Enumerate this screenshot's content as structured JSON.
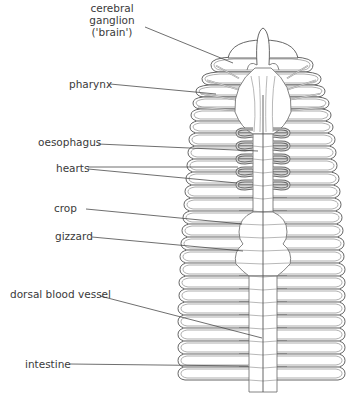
{
  "labels": [
    {
      "id": "cerebral-ganglion",
      "lines": [
        "cerebral",
        "ganglion",
        "('brain')"
      ],
      "x": 112,
      "y": 12,
      "anchor": "middle",
      "leader": [
        [
          145,
          27
        ],
        [
          233,
          63
        ]
      ]
    },
    {
      "id": "pharynx",
      "lines": [
        "pharynx"
      ],
      "x": 69,
      "y": 88,
      "anchor": "start",
      "leader": [
        [
          110,
          84
        ],
        [
          216,
          94
        ]
      ]
    },
    {
      "id": "oesophagus",
      "lines": [
        "oesophagus"
      ],
      "x": 38,
      "y": 146,
      "anchor": "start",
      "leader": [
        [
          98,
          144
        ],
        [
          258,
          151
        ]
      ]
    },
    {
      "id": "hearts",
      "lines": [
        "hearts"
      ],
      "x": 56,
      "y": 172,
      "anchor": "start",
      "leader": [
        [
          88,
          167
        ],
        [
          238,
          167
        ]
      ],
      "leader2": [
        [
          88,
          169
        ],
        [
          237,
          183
        ]
      ]
    },
    {
      "id": "crop",
      "lines": [
        "crop"
      ],
      "x": 54,
      "y": 212,
      "anchor": "start",
      "leader": [
        [
          86,
          209
        ],
        [
          242,
          224
        ]
      ]
    },
    {
      "id": "gizzard",
      "lines": [
        "gizzard"
      ],
      "x": 55,
      "y": 240,
      "anchor": "start",
      "leader": [
        [
          92,
          237
        ],
        [
          243,
          251
        ]
      ]
    },
    {
      "id": "dorsal-blood-vessel",
      "lines": [
        "dorsal blood vessel"
      ],
      "x": 10,
      "y": 298,
      "anchor": "start",
      "leader": [
        [
          100,
          296
        ],
        [
          262,
          338
        ]
      ]
    },
    {
      "id": "intestine",
      "lines": [
        "intestine"
      ],
      "x": 25,
      "y": 368,
      "anchor": "start",
      "leader": [
        [
          70,
          364
        ],
        [
          248,
          366
        ]
      ]
    }
  ],
  "worm": {
    "center_x": 263,
    "segments": [
      {
        "y": 57,
        "l": 228,
        "r": 298
      },
      {
        "y": 72,
        "l": 214,
        "r": 310
      },
      {
        "y": 85,
        "l": 205,
        "r": 318
      },
      {
        "y": 97,
        "l": 199,
        "r": 322
      },
      {
        "y": 109,
        "l": 196,
        "r": 326
      },
      {
        "y": 121,
        "l": 194,
        "r": 328
      },
      {
        "y": 133,
        "l": 193,
        "r": 330
      },
      {
        "y": 146,
        "l": 192,
        "r": 332
      },
      {
        "y": 159,
        "l": 191,
        "r": 333
      },
      {
        "y": 172,
        "l": 190,
        "r": 334
      },
      {
        "y": 185,
        "l": 189,
        "r": 336
      },
      {
        "y": 198,
        "l": 188,
        "r": 337
      },
      {
        "y": 211,
        "l": 187,
        "r": 338
      },
      {
        "y": 224,
        "l": 186,
        "r": 339
      },
      {
        "y": 237,
        "l": 185,
        "r": 340
      },
      {
        "y": 250,
        "l": 184,
        "r": 341
      },
      {
        "y": 263,
        "l": 183,
        "r": 341
      },
      {
        "y": 276,
        "l": 183,
        "r": 342
      },
      {
        "y": 289,
        "l": 182,
        "r": 342
      },
      {
        "y": 302,
        "l": 182,
        "r": 342
      },
      {
        "y": 315,
        "l": 181,
        "r": 342
      },
      {
        "y": 328,
        "l": 181,
        "r": 342
      },
      {
        "y": 341,
        "l": 181,
        "r": 342
      },
      {
        "y": 354,
        "l": 181,
        "r": 342
      },
      {
        "y": 367,
        "l": 181,
        "r": 342
      },
      {
        "y": 380,
        "l": 181,
        "r": 342
      }
    ],
    "hearts_y": [
      132,
      145,
      158,
      171,
      184
    ],
    "colors": {
      "outline": "#555555",
      "septum": "#8a8a8a",
      "heart": "#6a6a6a",
      "text": "#3a3a3a"
    }
  }
}
